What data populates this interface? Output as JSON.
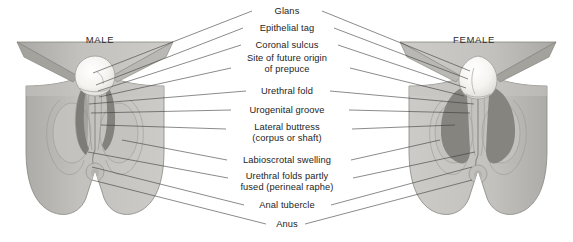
{
  "diagram": {
    "male_title": "MALE",
    "female_title": "FEMALE",
    "background_color": "#ffffff",
    "body_fill": "#bdbcb8",
    "body_fill_light": "#cbcac6",
    "shadow_fill": "#8b8a86",
    "dark_fold_fill": "#7e7d79",
    "glans_fill": "#f3f2ef",
    "outline_color": "#6e6d69",
    "leader_line_color": "#3c3c3c",
    "text_color": "#1d1d1d"
  },
  "labels": [
    {
      "id": "glans",
      "text": "Glans",
      "x": 287,
      "y": 11,
      "lines": 1
    },
    {
      "id": "epithelial-tag",
      "text": "Epithelial tag",
      "x": 287,
      "y": 28,
      "lines": 1
    },
    {
      "id": "coronal-sulcus",
      "text": "Coronal sulcus",
      "x": 287,
      "y": 45,
      "lines": 1
    },
    {
      "id": "site-of-future-origin-of-prepuce",
      "text": "Site of future origin",
      "text2": "of prepuce",
      "x": 287,
      "y": 64,
      "lines": 2
    },
    {
      "id": "urethral-fold",
      "text": "Urethral fold",
      "x": 287,
      "y": 91,
      "lines": 1
    },
    {
      "id": "urogenital-groove",
      "text": "Urogenital groove",
      "x": 287,
      "y": 110,
      "lines": 1
    },
    {
      "id": "lateral-buttress",
      "text": "Lateral buttress",
      "text2": "(corpus or shaft)",
      "x": 287,
      "y": 133,
      "lines": 2
    },
    {
      "id": "labioscrotal-swelling",
      "text": "Labioscrotal swelling",
      "x": 287,
      "y": 160,
      "lines": 1
    },
    {
      "id": "urethral-folds-partly-fused",
      "text": "Urethral folds partly",
      "text2": "fused (perineal raphe)",
      "x": 287,
      "y": 182,
      "lines": 2
    },
    {
      "id": "anal-tubercle",
      "text": "Anal tubercle",
      "x": 287,
      "y": 205,
      "lines": 1
    },
    {
      "id": "anus",
      "text": "Anus",
      "x": 287,
      "y": 224,
      "lines": 1
    }
  ],
  "male_title_pos": {
    "x": 100,
    "y": 39
  },
  "female_title_pos": {
    "x": 474,
    "y": 39
  },
  "leader_lines": {
    "male": [
      {
        "label": "glans",
        "x1": 252,
        "y1": 11,
        "x2": 93,
        "y2": 73
      },
      {
        "label": "epithelial-tag",
        "x1": 243,
        "y1": 28,
        "x2": 96,
        "y2": 85
      },
      {
        "label": "coronal-sulcus",
        "x1": 241,
        "y1": 45,
        "x2": 98,
        "y2": 91
      },
      {
        "label": "site-of-future-origin-of-prepuce",
        "x1": 231,
        "y1": 68,
        "x2": 99,
        "y2": 97
      },
      {
        "label": "urethral-fold",
        "x1": 246,
        "y1": 91,
        "x2": 89,
        "y2": 104
      },
      {
        "label": "urogenital-groove",
        "x1": 231,
        "y1": 110,
        "x2": 91,
        "y2": 113
      },
      {
        "label": "lateral-buttress",
        "x1": 226,
        "y1": 129,
        "x2": 101,
        "y2": 125
      },
      {
        "label": "labioscrotal-swelling",
        "x1": 227,
        "y1": 160,
        "x2": 122,
        "y2": 140
      },
      {
        "label": "urethral-folds-partly-fused",
        "x1": 228,
        "y1": 178,
        "x2": 88,
        "y2": 152
      },
      {
        "label": "anal-tubercle",
        "x1": 244,
        "y1": 205,
        "x2": 92,
        "y2": 167
      },
      {
        "label": "anus",
        "x1": 266,
        "y1": 224,
        "x2": 92,
        "y2": 180
      }
    ],
    "female": [
      {
        "label": "glans",
        "x1": 322,
        "y1": 11,
        "x2": 470,
        "y2": 71
      },
      {
        "label": "epithelial-tag",
        "x1": 334,
        "y1": 28,
        "x2": 468,
        "y2": 79
      },
      {
        "label": "coronal-sulcus",
        "x1": 338,
        "y1": 45,
        "x2": 466,
        "y2": 88
      },
      {
        "label": "site-of-future-origin-of-prepuce",
        "x1": 350,
        "y1": 68,
        "x2": 464,
        "y2": 96
      },
      {
        "label": "urethral-fold",
        "x1": 330,
        "y1": 91,
        "x2": 474,
        "y2": 104
      },
      {
        "label": "urogenital-groove",
        "x1": 349,
        "y1": 110,
        "x2": 470,
        "y2": 113
      },
      {
        "label": "lateral-buttress",
        "x1": 352,
        "y1": 129,
        "x2": 455,
        "y2": 125
      },
      {
        "label": "labioscrotal-swelling",
        "x1": 351,
        "y1": 160,
        "x2": 440,
        "y2": 140
      },
      {
        "label": "urethral-folds-partly-fused",
        "x1": 353,
        "y1": 178,
        "x2": 475,
        "y2": 152
      },
      {
        "label": "anal-tubercle",
        "x1": 331,
        "y1": 205,
        "x2": 472,
        "y2": 167
      },
      {
        "label": "anus",
        "x1": 305,
        "y1": 224,
        "x2": 472,
        "y2": 180
      }
    ]
  }
}
